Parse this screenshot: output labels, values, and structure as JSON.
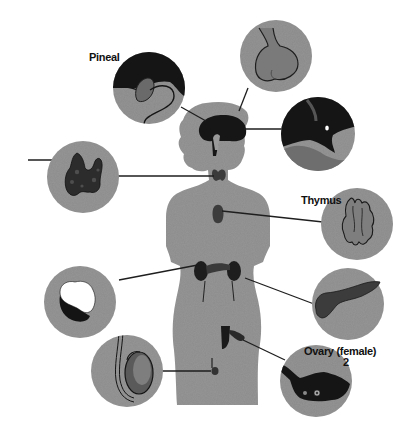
{
  "diagram": {
    "colors": {
      "background": "#ffffff",
      "body_fill": "#8c8c8c",
      "circle_fill": "#8a8a8a",
      "organ_dark": "#1a1a1a",
      "organ_mid": "#5a5a5a",
      "organ_light": "#a8a8a8",
      "leader_line": "#1e1e1e"
    },
    "labels": {
      "pineal": "Pineal",
      "thymus": "Thymus",
      "ovary": "Ovary (female)",
      "ovary_number": "2"
    },
    "callouts": [
      {
        "id": "pineal",
        "label": "Pineal"
      },
      {
        "id": "pituitary",
        "label": ""
      },
      {
        "id": "hypothalamus",
        "label": ""
      },
      {
        "id": "thyroid",
        "label": ""
      },
      {
        "id": "thymus",
        "label": "Thymus"
      },
      {
        "id": "adrenal",
        "label": ""
      },
      {
        "id": "pancreas",
        "label": ""
      },
      {
        "id": "testis",
        "label": ""
      },
      {
        "id": "ovary",
        "label": "Ovary (female) 2"
      }
    ]
  }
}
